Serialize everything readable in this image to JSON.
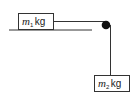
{
  "diagram": {
    "colors": {
      "line": "#333333",
      "pulley": "#111111",
      "background": "#ffffff"
    },
    "mass1": {
      "symbol": "m",
      "subscript": "1",
      "unit": "kg"
    },
    "mass2": {
      "symbol": "m",
      "subscript": "2",
      "unit": "kg"
    },
    "elements": [
      "table-surface",
      "block-m1",
      "rope-horizontal",
      "pulley",
      "rope-vertical",
      "block-m2"
    ]
  }
}
